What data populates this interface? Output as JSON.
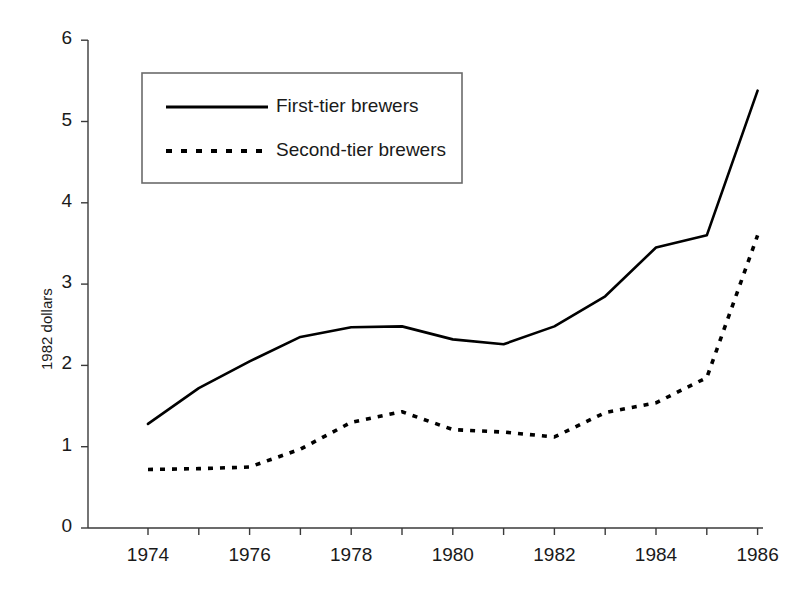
{
  "chart_data": {
    "type": "line",
    "title": "",
    "xlabel": "",
    "ylabel": "1982 dollars",
    "xlim": [
      1973.5,
      1986.5
    ],
    "ylim": [
      0,
      6
    ],
    "grid": false,
    "legend_position": "upper-left-inside",
    "x": [
      1974,
      1975,
      1976,
      1977,
      1978,
      1979,
      1980,
      1981,
      1982,
      1983,
      1984,
      1985,
      1986
    ],
    "xtick_labels": [
      "1974",
      "1976",
      "1978",
      "1980",
      "1982",
      "1984",
      "1986"
    ],
    "xtick_values": [
      1974,
      1976,
      1978,
      1980,
      1982,
      1984,
      1986
    ],
    "xminor_tick_values": [
      1975,
      1977,
      1979,
      1981,
      1983,
      1985
    ],
    "ytick_labels": [
      "0",
      "1",
      "2",
      "3",
      "4",
      "5",
      "6"
    ],
    "ytick_values": [
      0,
      1,
      2,
      3,
      4,
      5,
      6
    ],
    "series": [
      {
        "name": "First-tier brewers",
        "style": "solid",
        "color": "#000000",
        "values": [
          1.28,
          1.72,
          2.05,
          2.35,
          2.47,
          2.48,
          2.32,
          2.26,
          2.48,
          2.85,
          3.45,
          3.6,
          5.38
        ]
      },
      {
        "name": "Second-tier brewers",
        "style": "dashed",
        "color": "#000000",
        "values": [
          0.72,
          0.73,
          0.75,
          0.97,
          1.3,
          1.43,
          1.21,
          1.18,
          1.12,
          1.42,
          1.54,
          1.85,
          3.6
        ]
      }
    ]
  },
  "legend": {
    "entries": [
      {
        "label": "First-tier brewers",
        "style": "solid"
      },
      {
        "label": "Second-tier brewers",
        "style": "dashed"
      }
    ]
  },
  "axes": {
    "y_title": "1982 dollars"
  }
}
